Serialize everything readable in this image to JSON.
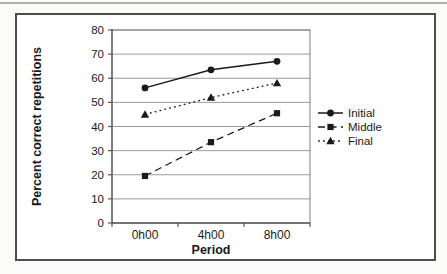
{
  "chart_data": {
    "type": "line",
    "title": "",
    "xlabel": "Period",
    "ylabel": "Percent correct repetitions",
    "categories": [
      "0h00",
      "4h00",
      "8h00"
    ],
    "ylim": [
      0,
      80
    ],
    "yticks": [
      0,
      10,
      20,
      30,
      40,
      50,
      60,
      70,
      80
    ],
    "grid": true,
    "legend_position": "right",
    "series": [
      {
        "name": "Initial",
        "values": [
          56,
          63.5,
          67
        ],
        "line": "solid",
        "marker": "circle"
      },
      {
        "name": "Middle",
        "values": [
          19.5,
          33.5,
          45.5
        ],
        "line": "dashed",
        "marker": "square"
      },
      {
        "name": "Final",
        "values": [
          45,
          52,
          58
        ],
        "line": "dotted",
        "marker": "triangle"
      }
    ],
    "colors": {
      "series": "#1a1a1a",
      "grid": "#9b9b9b",
      "axis": "#5a5a5a",
      "plot_border": "#7e7e7e",
      "frame_border": "#4e4e4e",
      "top_rule": "#aeaeae"
    }
  }
}
